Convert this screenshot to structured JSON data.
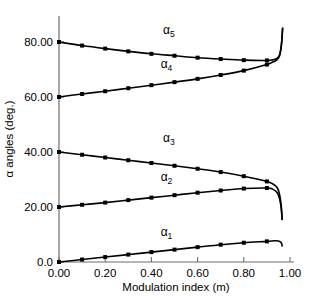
{
  "chart_data": {
    "type": "line",
    "title": "",
    "xlabel": "Modulation index (m)",
    "ylabel": "α angles (deg.)",
    "xlim": [
      0.0,
      1.0
    ],
    "ylim": [
      0.0,
      88.0
    ],
    "grid": false,
    "legend": "inline-curve-labels",
    "xticks": [
      0.0,
      0.2,
      0.4,
      0.6,
      0.8,
      1.0
    ],
    "xtick_labels": [
      "0.00",
      "0.20",
      "0.40",
      "0.60",
      "0.80",
      "1.00"
    ],
    "yticks": [
      0.0,
      20.0,
      40.0,
      60.0,
      80.0
    ],
    "ytick_labels": [
      "0.0",
      "20.00",
      "40.00",
      "60.00",
      "80.00"
    ],
    "x": [
      0.0,
      0.1,
      0.2,
      0.3,
      0.4,
      0.5,
      0.6,
      0.7,
      0.8,
      0.9
    ],
    "series": [
      {
        "name": "α_1",
        "label_base": "α",
        "label_sub": "1",
        "label_x": 0.44,
        "label_y": 9.6,
        "values": [
          0.0,
          0.9,
          1.8,
          2.7,
          3.6,
          4.5,
          5.4,
          6.3,
          7.0,
          7.5
        ],
        "tail_x": [
          0.9,
          0.93,
          0.95,
          0.962,
          0.966
        ],
        "tail_y": [
          7.5,
          7.7,
          7.6,
          7.0,
          5.8
        ]
      },
      {
        "name": "α_2",
        "label_base": "α",
        "label_sub": "2",
        "label_x": 0.44,
        "label_y": 29.6,
        "values": [
          20.0,
          20.8,
          21.6,
          22.5,
          23.4,
          24.3,
          25.2,
          26.0,
          26.7,
          26.9
        ],
        "tail_x": [
          0.9,
          0.925,
          0.945,
          0.955,
          0.962,
          0.966
        ],
        "tail_y": [
          26.9,
          26.5,
          25.2,
          23.0,
          19.5,
          15.5
        ]
      },
      {
        "name": "α_3",
        "label_base": "α",
        "label_sub": "3",
        "label_x": 0.45,
        "label_y": 43.5,
        "values": [
          40.0,
          39.0,
          38.0,
          37.0,
          36.0,
          35.0,
          33.9,
          32.7,
          31.2,
          29.3
        ],
        "tail_x": [
          0.9,
          0.925,
          0.945,
          0.955,
          0.962,
          0.966
        ],
        "tail_y": [
          29.3,
          28.4,
          27.0,
          24.5,
          20.5,
          15.5
        ]
      },
      {
        "name": "α_4",
        "label_base": "α",
        "label_sub": "4",
        "label_x": 0.44,
        "label_y": 70.5,
        "values": [
          60.0,
          61.1,
          62.1,
          63.2,
          64.3,
          65.4,
          66.6,
          68.0,
          69.6,
          71.8
        ],
        "tail_x": [
          0.9,
          0.925,
          0.942,
          0.955,
          0.963,
          0.968
        ],
        "tail_y": [
          71.8,
          72.7,
          73.4,
          75.0,
          79.0,
          85.0
        ]
      },
      {
        "name": "α_5",
        "label_base": "α",
        "label_sub": "5",
        "label_x": 0.45,
        "label_y": 83.0,
        "values": [
          80.0,
          78.7,
          77.6,
          76.6,
          75.7,
          75.0,
          74.3,
          73.8,
          73.4,
          73.3
        ],
        "tail_x": [
          0.9,
          0.925,
          0.942,
          0.955,
          0.963,
          0.968
        ],
        "tail_y": [
          73.3,
          73.5,
          74.0,
          75.4,
          79.2,
          85.0
        ]
      }
    ]
  }
}
